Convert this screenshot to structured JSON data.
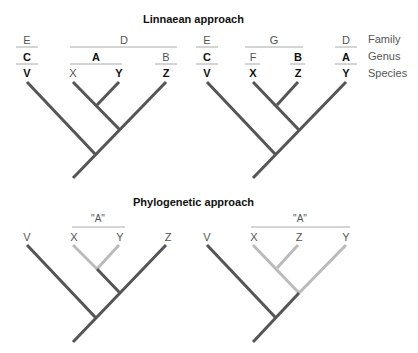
{
  "sections": {
    "linnaean": {
      "title": "Linnaean approach"
    },
    "phylogenetic": {
      "title": "Phylogenetic approach"
    }
  },
  "rank_labels": {
    "family": "Family",
    "genus": "Genus",
    "species": "Species"
  },
  "linnaean_tree_1": {
    "family": [
      "E",
      "D"
    ],
    "genus": [
      "C",
      "A",
      "B"
    ],
    "species": [
      "V",
      "X",
      "Y",
      "Z"
    ]
  },
  "linnaean_tree_2": {
    "family": [
      "E",
      "G",
      "D"
    ],
    "genus": [
      "C",
      "F",
      "B",
      "A"
    ],
    "species": [
      "V",
      "X",
      "Z",
      "Y"
    ]
  },
  "phylo_tree_1": {
    "group_label": "\"A\"",
    "tips": [
      "V",
      "X",
      "Y",
      "Z"
    ]
  },
  "phylo_tree_2": {
    "group_label": "\"A\"",
    "tips": [
      "V",
      "X",
      "Z",
      "Y"
    ]
  },
  "colors": {
    "branch": "#555555",
    "highlight": "#bbbbbb",
    "rule": "#aaaaaa"
  }
}
